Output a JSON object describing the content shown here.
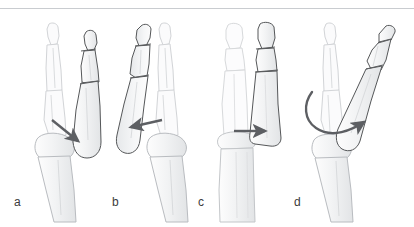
{
  "figure": {
    "background_color": "#ffffff",
    "rule_color": "#c9ccd0"
  },
  "style": {
    "bone_outline_color": "#4a4a4a",
    "ghost_outline_color": "#d2d4d7",
    "bone_fill_color": "#f4f5f6",
    "bone_shade_color": "#e3e5e7",
    "arrow_color": "#5d5f63",
    "label_color": "#3b3b3b"
  },
  "panels": [
    {
      "id": "a",
      "label": "a",
      "view": "lateral",
      "arrow": {
        "name": "volar-displacement-arrow",
        "type": "straight",
        "direction": "down-right",
        "from": [
          52,
          120
        ],
        "to": [
          80,
          143
        ]
      },
      "ghost_side": "left",
      "displaced_side": "right"
    },
    {
      "id": "b",
      "label": "b",
      "view": "lateral",
      "arrow": {
        "name": "dorsal-displacement-arrow",
        "type": "straight",
        "direction": "left",
        "from": [
          161,
          121
        ],
        "to": [
          130,
          128
        ]
      },
      "ghost_side": "right",
      "displaced_side": "left"
    },
    {
      "id": "c",
      "label": "c",
      "view": "anteroposterior",
      "arrow": {
        "name": "lateral-displacement-arrow",
        "type": "straight",
        "direction": "right",
        "from": [
          234,
          131
        ],
        "to": [
          267,
          131
        ]
      },
      "ghost_side": "left",
      "displaced_side": "right"
    },
    {
      "id": "d",
      "label": "d",
      "view": "lateral-oblique",
      "arrow": {
        "name": "rotational-displacement-arrow",
        "type": "curved",
        "direction": "clockwise-sweep",
        "from": [
          313,
          92
        ],
        "to": [
          367,
          122
        ]
      },
      "ghost_side": "left",
      "displaced_side": "right"
    }
  ]
}
